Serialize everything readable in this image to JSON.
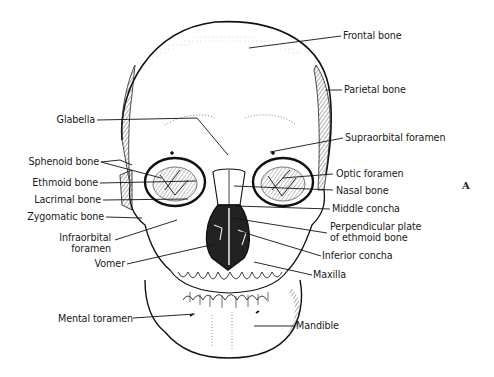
{
  "figure": {
    "panel_label": "A",
    "labels": {
      "frontal_bone": "Frontal bone",
      "parietal_bone": "Parietal bone",
      "glabella": "Glabella",
      "supraorbital_foramen": "Supraorbital foramen",
      "sphenoid_bone": "Sphenoid bone",
      "ethmoid_bone": "Ethmoid bone",
      "optic_foramen": "Optic foramen",
      "nasal_bone": "Nasal bone",
      "lacrimal_bone": "Lacrimal bone",
      "middle_concha": "Middle concha",
      "zygomatic_bone": "Zygomatic bone",
      "perpendicular_plate_line1": "Perpendicular plate",
      "perpendicular_plate_line2": "of ethmoid bone",
      "infraorbital_line1": "Infraorbital",
      "infraorbital_line2": "foramen",
      "inferior_concha": "Inferior concha",
      "vomer": "Vomer",
      "maxilla": "Maxilla",
      "mental_foramen": "Mental toramen",
      "mandible": "Mandible"
    }
  }
}
